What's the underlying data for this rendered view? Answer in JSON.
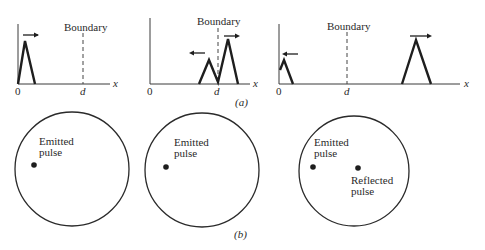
{
  "figure": {
    "part_a_label": "(a)",
    "part_b_label": "(b)",
    "part_a": {
      "description": "Pulse on a 1D line traveling toward a boundary at x = d, partial reflection",
      "panels": [
        {
          "origin_label": "0",
          "boundary_tick_label": "d",
          "axis_label": "x",
          "boundary_label": "Boundary",
          "pulses": [
            {
              "direction": "right",
              "size": "large",
              "position": "near origin"
            }
          ]
        },
        {
          "origin_label": "0",
          "boundary_tick_label": "d",
          "axis_label": "x",
          "boundary_label": "Boundary",
          "pulses": [
            {
              "direction": "left",
              "size": "small",
              "position": "just left of boundary (reflected)"
            },
            {
              "direction": "right",
              "size": "large",
              "position": "just right of boundary (transmitted)"
            }
          ]
        },
        {
          "origin_label": "0",
          "boundary_tick_label": "d",
          "axis_label": "x",
          "boundary_label": "Boundary",
          "pulses": [
            {
              "direction": "left",
              "size": "small",
              "position": "near origin (reflected)"
            },
            {
              "direction": "right",
              "size": "large",
              "position": "far right of boundary (transmitted)"
            }
          ]
        }
      ]
    },
    "part_b": {
      "panels": [
        {
          "dots": [
            {
              "label_line1": "Emitted",
              "label_line2": "pulse"
            }
          ]
        },
        {
          "dots": [
            {
              "label_line1": "Emitted",
              "label_line2": "pulse"
            }
          ]
        },
        {
          "dots": [
            {
              "label_line1": "Emitted",
              "label_line2": "pulse"
            },
            {
              "label_line1": "Reflected",
              "label_line2": "pulse"
            }
          ]
        }
      ]
    }
  }
}
